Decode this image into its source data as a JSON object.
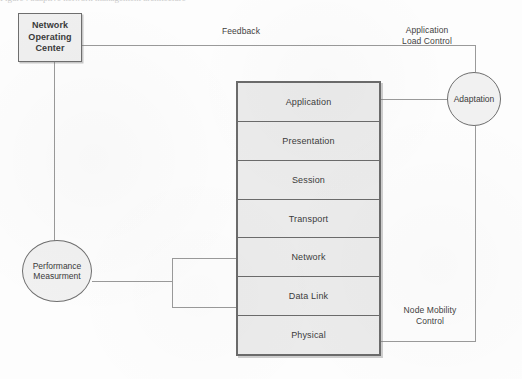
{
  "figure": {
    "top_crop_fragment": "Figure  :  adaptive  network  management  architecture"
  },
  "nodes": {
    "noc": {
      "label": "Network\nOperating\nCenter",
      "line1": "Network",
      "line2": "Operating",
      "line3": "Center",
      "shape": "rectangle"
    },
    "adaptation": {
      "label": "Adaptation",
      "shape": "circle"
    },
    "performance": {
      "label": "Performance\nMeasurment",
      "line1": "Performance",
      "line2": "Measurment",
      "shape": "circle"
    }
  },
  "stack": {
    "name": "OSI protocol stack",
    "layers": [
      {
        "label": "Application"
      },
      {
        "label": "Presentation"
      },
      {
        "label": "Session"
      },
      {
        "label": "Transport"
      },
      {
        "label": "Network"
      },
      {
        "label": "Data Link"
      },
      {
        "label": "Physical"
      }
    ]
  },
  "edge_labels": {
    "feedback": "Feedback",
    "application_load_control": "Application\nLoad Control",
    "application_load_control_line1": "Application",
    "application_load_control_line2": "Load Control",
    "node_mobility_control": "Node Mobility\nControl",
    "node_mobility_control_line1": "Node Mobility",
    "node_mobility_control_line2": "Control"
  },
  "connections": [
    {
      "from": "noc",
      "to": "adaptation",
      "label": "Feedback"
    },
    {
      "from": "noc",
      "to": "performance",
      "label": ""
    },
    {
      "from": "adaptation",
      "to": "application-layer",
      "label": "Application Load Control"
    },
    {
      "from": "adaptation",
      "to": "physical-layer",
      "label": "Node Mobility Control"
    },
    {
      "from": "performance",
      "to": "network-and-data-link-layers",
      "label": ""
    }
  ],
  "colors": {
    "stroke": "#6b6b6b",
    "layer_fill": "#ebebeb",
    "box_fill": "#efefef",
    "circle_fill": "#f1f1f1",
    "wire": "#9a9a9a",
    "text": "#3a3a3a",
    "background": "#fdfdfd"
  }
}
